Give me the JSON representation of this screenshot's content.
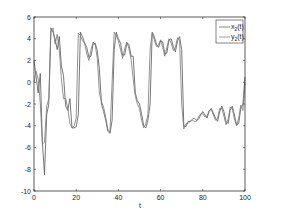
{
  "chart_data": {
    "type": "line",
    "title": "",
    "xlabel": "t",
    "ylabel": "",
    "xlim": [
      0,
      100
    ],
    "ylim": [
      -10,
      6
    ],
    "xticks": [
      0,
      20,
      40,
      60,
      80,
      100
    ],
    "yticks": [
      -10,
      -8,
      -6,
      -4,
      -2,
      0,
      2,
      4,
      6
    ],
    "grid": false,
    "legend_position": "upper right",
    "series": [
      {
        "name": "x2(t)",
        "label_main": "x",
        "label_sub": "2",
        "label_tail": "(t)",
        "color": "#555555",
        "x": [
          0,
          1,
          2,
          3,
          4,
          5,
          6,
          7,
          8,
          9,
          10,
          11,
          12,
          13,
          14,
          15,
          16,
          17,
          18,
          19,
          20,
          21,
          22,
          23,
          24,
          25,
          26,
          27,
          28,
          29,
          30,
          31,
          32,
          33,
          34,
          35,
          36,
          37,
          38,
          39,
          40,
          41,
          42,
          43,
          44,
          45,
          46,
          47,
          48,
          49,
          50,
          51,
          52,
          53,
          54,
          55,
          56,
          57,
          58,
          59,
          60,
          61,
          62,
          63,
          64,
          65,
          66,
          67,
          68,
          69,
          70,
          71,
          72,
          73,
          74,
          75,
          76,
          77,
          78,
          79,
          80,
          81,
          82,
          83,
          84,
          85,
          86,
          87,
          88,
          89,
          90,
          91,
          92,
          93,
          94,
          95,
          96,
          97,
          98,
          99,
          100
        ],
        "y": [
          2,
          0.5,
          -1,
          0.8,
          -5.5,
          -8.5,
          -3,
          -2,
          5,
          4.6,
          4,
          3,
          4.2,
          1.5,
          0.6,
          -2.2,
          -2.6,
          -1.5,
          -4.2,
          -4.2,
          -4.1,
          -3,
          4.6,
          4.2,
          3.6,
          3.2,
          2.3,
          2.4,
          3.5,
          3.6,
          2.9,
          1.2,
          -2,
          -2.7,
          -3.5,
          -4.5,
          -4.7,
          -3.5,
          3,
          4.6,
          4,
          3.6,
          2.5,
          2.5,
          3.6,
          3.5,
          2.4,
          2.4,
          -1,
          -1.7,
          -2,
          -2.9,
          -4,
          -4.2,
          -3.5,
          -2,
          4.6,
          4.2,
          3.5,
          3.2,
          3.8,
          3.7,
          2.6,
          2.7,
          3.9,
          4,
          3.3,
          2.8,
          3.8,
          4.2,
          3,
          -4,
          -4.1,
          -3.6,
          -3.6,
          -3.4,
          -3.3,
          -3.5,
          -3.4,
          -3,
          -2.7,
          -3,
          -3.3,
          -2.7,
          -2.4,
          -2.8,
          -3.3,
          -3.6,
          -2.7,
          -2.2,
          -2.7,
          -3.6,
          -3.8,
          -2.6,
          -2.2,
          -3,
          -3.9,
          -3.8,
          -2.4,
          -2,
          0.5
        ]
      },
      {
        "name": "y2(t)",
        "label_main": "y",
        "label_sub": "2",
        "label_tail": "(t)",
        "color": "#777777",
        "x": [
          0,
          1,
          2,
          3,
          4,
          5,
          6,
          7,
          8,
          9,
          10,
          11,
          12,
          13,
          14,
          15,
          16,
          17,
          18,
          19,
          20,
          21,
          22,
          23,
          24,
          25,
          26,
          27,
          28,
          29,
          30,
          31,
          32,
          33,
          34,
          35,
          36,
          37,
          38,
          39,
          40,
          41,
          42,
          43,
          44,
          45,
          46,
          47,
          48,
          49,
          50,
          51,
          52,
          53,
          54,
          55,
          56,
          57,
          58,
          59,
          60,
          61,
          62,
          63,
          64,
          65,
          66,
          67,
          68,
          69,
          70,
          71,
          72,
          73,
          74,
          75,
          76,
          77,
          78,
          79,
          80,
          81,
          82,
          83,
          84,
          85,
          86,
          87,
          88,
          89,
          90,
          91,
          92,
          93,
          94,
          95,
          96,
          97,
          98,
          99,
          100
        ],
        "y": [
          0,
          1,
          0.3,
          -2,
          -5.7,
          -5.5,
          -2.2,
          -1.5,
          4.6,
          5,
          3.5,
          4.4,
          3,
          0.3,
          -1.5,
          -1.5,
          -2.4,
          -3.8,
          -4.2,
          -4,
          -3.3,
          4.5,
          4.3,
          3.8,
          3.6,
          2.6,
          2,
          3,
          3.7,
          3.4,
          2.2,
          -1,
          -1.8,
          -2.3,
          -3.2,
          -4.3,
          -4.6,
          0,
          4.6,
          4.3,
          3.8,
          3,
          2.2,
          3.1,
          3.7,
          3.1,
          2.1,
          0.3,
          -1.3,
          -2,
          -2.4,
          -3.5,
          -4.2,
          -3.8,
          -3,
          3,
          4.5,
          3.9,
          3.3,
          3.4,
          3.9,
          3.2,
          2.4,
          3.2,
          4,
          3.6,
          2.9,
          3.2,
          4.1,
          3.8,
          -2,
          -4.3,
          -3.8,
          -3.8,
          -3.6,
          -3.5,
          -3.6,
          -3.6,
          -3.2,
          -2.9,
          -2.9,
          -3.2,
          -3.1,
          -2.6,
          -2.5,
          -3,
          -3.5,
          -3.3,
          -2.4,
          -2.4,
          -3.1,
          -3.9,
          -3.4,
          -2.3,
          -2.4,
          -3.4,
          -4,
          -3.3,
          -2.1,
          -2.6,
          0
        ]
      }
    ]
  },
  "legend": {
    "items": [
      {
        "main": "x",
        "sub": "2",
        "tail": "(t)"
      },
      {
        "main": "y",
        "sub": "2",
        "tail": "(t)"
      }
    ]
  },
  "axes": {
    "xlabel": "t"
  }
}
